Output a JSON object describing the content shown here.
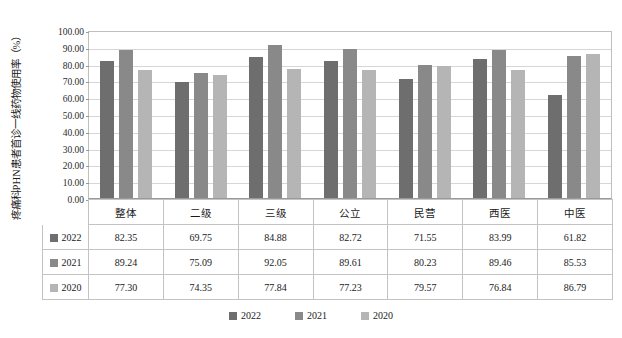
{
  "chart_data": {
    "type": "bar",
    "title": "",
    "xlabel": "",
    "ylabel": "疼痛科PHN患者首诊一线药物使用率（%）",
    "ylim": [
      0,
      100
    ],
    "ytick_labels": [
      "100.00",
      "90.00",
      "80.00",
      "70.00",
      "60.00",
      "50.00",
      "40.00",
      "30.00",
      "20.00",
      "10.00",
      "0.00"
    ],
    "ytick_values": [
      100,
      90,
      80,
      70,
      60,
      50,
      40,
      30,
      20,
      10,
      0
    ],
    "grid": true,
    "legend_position": "bottom",
    "categories": [
      "整体",
      "二级",
      "三级",
      "公立",
      "民营",
      "西医",
      "中医"
    ],
    "series": [
      {
        "name": "2022",
        "color": "#6e6e6e",
        "values": [
          82.35,
          69.75,
          84.88,
          82.72,
          71.55,
          83.99,
          61.82
        ],
        "labels": [
          "82.35",
          "69.75",
          "84.88",
          "82.72",
          "71.55",
          "83.99",
          "61.82"
        ]
      },
      {
        "name": "2021",
        "color": "#898989",
        "values": [
          89.24,
          75.09,
          92.05,
          89.61,
          80.23,
          89.46,
          85.53
        ],
        "labels": [
          "89.24",
          "75.09",
          "92.05",
          "89.61",
          "80.23",
          "89.46",
          "85.53"
        ]
      },
      {
        "name": "2020",
        "color": "#b5b5b5",
        "values": [
          77.3,
          74.35,
          77.84,
          77.23,
          79.57,
          76.84,
          86.79
        ],
        "labels": [
          "77.30",
          "74.35",
          "77.84",
          "77.23",
          "79.57",
          "76.84",
          "86.79"
        ]
      }
    ]
  },
  "legend": {
    "items": [
      {
        "label": "2022",
        "color": "#6e6e6e"
      },
      {
        "label": "2021",
        "color": "#898989"
      },
      {
        "label": "2020",
        "color": "#b5b5b5"
      }
    ]
  }
}
